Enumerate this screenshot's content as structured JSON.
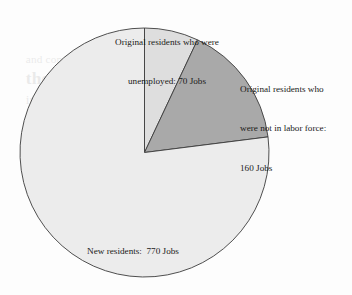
{
  "chart_data": {
    "type": "pie",
    "title": "",
    "subtitle": "",
    "xlabel": "",
    "ylabel": "",
    "units": "Jobs",
    "total": 1000,
    "legend_position": "none",
    "grid": false,
    "start_angle_deg": -90,
    "direction": "clockwise",
    "categories": [
      "Original residents who were unemployed",
      "Original residents who were not in labor force",
      "New residents"
    ],
    "values": [
      70,
      160,
      770
    ],
    "slices": [
      {
        "name": "original-unemployed",
        "label_line_1": "Original residents who were",
        "label_line_2": "unemployed: 70 Jobs",
        "label_line_3": "",
        "value": 70,
        "value_text": "70 Jobs",
        "percent": 7.0,
        "sweep_deg": 25.2,
        "start_deg": -90,
        "end_deg": -64.8,
        "color": "#dedede",
        "stroke": "#3c3c3c"
      },
      {
        "name": "original-not-in-labor-force",
        "label_line_1": "Original residents who",
        "label_line_2": "were not in labor force:",
        "label_line_3": "160 Jobs",
        "value": 160,
        "value_text": "160 Jobs",
        "percent": 16.0,
        "sweep_deg": 57.6,
        "start_deg": -64.8,
        "end_deg": -7.2,
        "color": "#a9a9a9",
        "stroke": "#3c3c3c"
      },
      {
        "name": "new-residents",
        "label_line_1": "New residents:  770 Jobs",
        "label_line_2": "",
        "label_line_3": "",
        "value": 770,
        "value_text": "770 Jobs",
        "percent": 77.0,
        "sweep_deg": 277.2,
        "start_deg": -7.2,
        "end_deg": 270,
        "color": "#ececec",
        "stroke": "#3c3c3c"
      }
    ]
  },
  "labels": {
    "unemployed": {
      "line1": "Original residents who were",
      "line2": "unemployed: 70 Jobs"
    },
    "not_in_labor_force": {
      "line1": "Original residents who",
      "line2": "were not in labor force:",
      "line3": "160 Jobs"
    },
    "new_residents": {
      "line1": "New residents:  770 Jobs"
    }
  },
  "bleed_through": {
    "line1": "and compare",
    "line2": "the bank",
    "line3": "industry in New York",
    "line4": "a surveyed city"
  },
  "colors": {
    "background": "#fdfdfd",
    "slice_light": "#ececec",
    "slice_mid": "#dedede",
    "slice_dark": "#a9a9a9",
    "outline": "#3c3c3c",
    "text": "#1a1a1a"
  }
}
